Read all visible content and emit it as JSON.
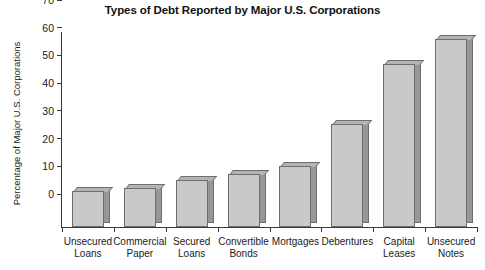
{
  "chart_data": {
    "type": "bar",
    "title": "Types of Debt Reported by Major U.S. Corporations",
    "xlabel": "",
    "ylabel": "Percentage of Major U.S. Corporations",
    "categories": [
      "Unsecured Loans",
      "Commercial Paper",
      "Secured Loans",
      "Convertible Bonds",
      "Mortgages",
      "Debentures",
      "Capital Leases",
      "Unsecured Notes"
    ],
    "category_lines": [
      [
        "Unsecured",
        "Loans"
      ],
      [
        "Commercial",
        "Paper"
      ],
      [
        "Secured",
        "Loans"
      ],
      [
        "Convertible",
        "Bonds"
      ],
      [
        "Mortgages",
        ""
      ],
      [
        "Debentures",
        ""
      ],
      [
        "Capital",
        "Leases"
      ],
      [
        "Unsecured",
        "Notes"
      ]
    ],
    "values": [
      13,
      14,
      17,
      19,
      22,
      37,
      59,
      68
    ],
    "ylim": [
      0,
      70
    ],
    "yticks": [
      0,
      10,
      20,
      30,
      40,
      50,
      60,
      70
    ],
    "grid": false,
    "legend": null,
    "colors": {
      "bar_face": "#c9c9c9",
      "bar_side": "#979797",
      "bar_top": "#b4b4b4",
      "bar_outline": "#6e6e6e",
      "axis": "#3a3a3a",
      "text": "#1a1a1a",
      "background": "#ffffff"
    }
  }
}
